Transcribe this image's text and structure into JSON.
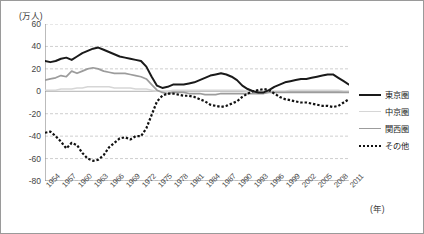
{
  "chart_data": {
    "type": "line",
    "title": "",
    "subtitle": "",
    "ylabel": "(万人)",
    "xlabel": "(年)",
    "ylim": [
      -80,
      60
    ],
    "yticks": [
      60,
      40,
      20,
      0,
      -20,
      -40,
      -60,
      -80
    ],
    "ytick_labels": [
      "60",
      "40",
      "20",
      "0",
      "-20",
      "-40",
      "-60",
      "-80"
    ],
    "xlim": [
      1954,
      2011
    ],
    "xticks": [
      1954,
      1957,
      1960,
      1963,
      1966,
      1969,
      1972,
      1975,
      1978,
      1981,
      1984,
      1987,
      1990,
      1993,
      1996,
      1999,
      2002,
      2005,
      2008,
      2011
    ],
    "xtick_labels": [
      "1954",
      "1957",
      "1960",
      "1963",
      "1966",
      "1969",
      "1972",
      "1975",
      "1978",
      "1981",
      "1984",
      "1987",
      "1990",
      "1993",
      "1996",
      "1999",
      "2002",
      "2005",
      "2008",
      "2011"
    ],
    "grid": true,
    "grid_style": "dashed-horizontal",
    "legend_position": "right",
    "x": [
      1954,
      1955,
      1956,
      1957,
      1958,
      1959,
      1960,
      1961,
      1962,
      1963,
      1964,
      1965,
      1966,
      1967,
      1968,
      1969,
      1970,
      1971,
      1972,
      1973,
      1974,
      1975,
      1976,
      1977,
      1978,
      1979,
      1980,
      1981,
      1982,
      1983,
      1984,
      1985,
      1986,
      1987,
      1988,
      1989,
      1990,
      1991,
      1992,
      1993,
      1994,
      1995,
      1996,
      1997,
      1998,
      1999,
      2000,
      2001,
      2002,
      2003,
      2004,
      2005,
      2006,
      2007,
      2008,
      2009,
      2010,
      2011
    ],
    "series": [
      {
        "name": "東京圏",
        "color": "#1a1a1a",
        "style": "solid-thick",
        "values": [
          27,
          26,
          27,
          29,
          30,
          28,
          31,
          34,
          36,
          38,
          39,
          37,
          35,
          33,
          31,
          30,
          29,
          28,
          27,
          22,
          13,
          5,
          3,
          4,
          6,
          6,
          6,
          7,
          8,
          10,
          12,
          14,
          15,
          16,
          15,
          13,
          10,
          5,
          2,
          0,
          -1,
          -1,
          1,
          4,
          6,
          8,
          9,
          10,
          11,
          11,
          12,
          13,
          14,
          15,
          15,
          12,
          9,
          6
        ]
      },
      {
        "name": "中京圏",
        "color": "#d6d6d6",
        "style": "solid-thin",
        "values": [
          1,
          1,
          1,
          2,
          2,
          2,
          3,
          3,
          4,
          4,
          4,
          4,
          4,
          3,
          3,
          3,
          3,
          2,
          2,
          2,
          1,
          0,
          0,
          0,
          1,
          1,
          1,
          1,
          1,
          1,
          1,
          1,
          1,
          1,
          1,
          1,
          1,
          1,
          0,
          0,
          0,
          0,
          0,
          0,
          0,
          0,
          1,
          1,
          1,
          1,
          1,
          1,
          1,
          1,
          1,
          1,
          0,
          0
        ]
      },
      {
        "name": "関西圏",
        "color": "#9c9c9c",
        "style": "solid-med",
        "values": [
          10,
          11,
          12,
          14,
          13,
          18,
          16,
          18,
          20,
          21,
          20,
          18,
          17,
          16,
          16,
          16,
          15,
          14,
          13,
          11,
          6,
          1,
          -1,
          -2,
          -1,
          -1,
          -1,
          -2,
          -2,
          -2,
          -3,
          -3,
          -3,
          -2,
          -2,
          -2,
          -2,
          -2,
          -2,
          -2,
          -2,
          -2,
          -1,
          -1,
          -1,
          -1,
          -1,
          -1,
          -1,
          -1,
          -1,
          -1,
          -1,
          -1,
          -1,
          -1,
          -1,
          -1
        ]
      },
      {
        "name": "その他",
        "color": "#111111",
        "style": "dotted",
        "values": [
          -37,
          -36,
          -40,
          -45,
          -51,
          -46,
          -48,
          -55,
          -60,
          -62,
          -61,
          -57,
          -50,
          -46,
          -42,
          -41,
          -43,
          -40,
          -40,
          -33,
          -21,
          -9,
          -4,
          -2,
          -2,
          -3,
          -4,
          -4,
          -5,
          -7,
          -9,
          -12,
          -13,
          -14,
          -13,
          -11,
          -9,
          -5,
          -2,
          0,
          1,
          2,
          1,
          -2,
          -5,
          -7,
          -8,
          -9,
          -10,
          -10,
          -11,
          -12,
          -13,
          -13,
          -14,
          -13,
          -10,
          -7
        ]
      }
    ]
  },
  "legend": {
    "items": [
      {
        "label": "東京圏"
      },
      {
        "label": "中京圏"
      },
      {
        "label": "関西圏"
      },
      {
        "label": "その他"
      }
    ]
  }
}
